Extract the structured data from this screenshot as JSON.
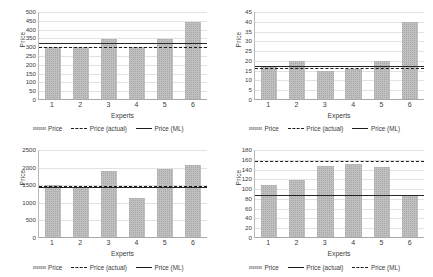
{
  "figure": {
    "panels": [
      "chart-top-left",
      "chart-top-right",
      "chart-bottom-left",
      "chart-bottom-right"
    ],
    "bar_color": "#bfbfbf",
    "line_color": "#1d1d1d",
    "grid_color": "#e2e2e2"
  },
  "chart_data": [
    {
      "id": "chart-top-left",
      "type": "bar",
      "title": "",
      "xlabel": "Experts",
      "ylabel": "Price",
      "categories": [
        "1",
        "2",
        "3",
        "4",
        "5",
        "6"
      ],
      "yticks": [
        0,
        50,
        100,
        150,
        200,
        250,
        300,
        350,
        400,
        450,
        500
      ],
      "ylim": [
        0,
        500
      ],
      "grid": true,
      "legend_position": "bottom",
      "series": [
        {
          "name": "Price",
          "style": "bar",
          "values": [
            300,
            300,
            345,
            300,
            345,
            445
          ]
        },
        {
          "name": "Price (actual)",
          "style": "dashed-line",
          "value": 300
        },
        {
          "name": "Price (ML)",
          "style": "solid-line",
          "value": 322
        }
      ],
      "legend": [
        {
          "label": "Price",
          "swatch": "bar"
        },
        {
          "label": "Price (actual)",
          "swatch": "dashed"
        },
        {
          "label": "Price (ML)",
          "swatch": "solid"
        }
      ]
    },
    {
      "id": "chart-top-right",
      "type": "bar",
      "title": "",
      "xlabel": "Experts",
      "ylabel": "Price",
      "categories": [
        "1",
        "2",
        "3",
        "4",
        "5",
        "6"
      ],
      "yticks": [
        0,
        5,
        10,
        15,
        20,
        25,
        30,
        35,
        40,
        45
      ],
      "ylim": [
        0,
        45
      ],
      "grid": true,
      "legend_position": "bottom",
      "series": [
        {
          "name": "Price",
          "style": "bar",
          "values": [
            17,
            20,
            15,
            16,
            20,
            40
          ]
        },
        {
          "name": "Price (actual)",
          "style": "dashed-line",
          "value": 16.5
        },
        {
          "name": "Price (ML)",
          "style": "solid-line",
          "value": 17.2
        }
      ],
      "legend": [
        {
          "label": "Price",
          "swatch": "bar"
        },
        {
          "label": "Price (actual)",
          "swatch": "dashed"
        },
        {
          "label": "Price (ML)",
          "swatch": "solid"
        }
      ]
    },
    {
      "id": "chart-bottom-left",
      "type": "bar",
      "title": "",
      "xlabel": "Experts",
      "ylabel": "Price",
      "categories": [
        "1",
        "2",
        "3",
        "4",
        "5",
        "6"
      ],
      "yticks": [
        0,
        500,
        1000,
        1500,
        2000,
        2500
      ],
      "ylim": [
        0,
        2500
      ],
      "grid": true,
      "legend_position": "bottom",
      "series": [
        {
          "name": "Price",
          "style": "bar",
          "values": [
            1500,
            1450,
            1900,
            1150,
            1970,
            2070
          ]
        },
        {
          "name": "Price (actual)",
          "style": "dashed-line",
          "value": 1470
        },
        {
          "name": "Price (ML)",
          "style": "solid-line",
          "value": 1455
        }
      ],
      "legend": [
        {
          "label": "Price",
          "swatch": "bar"
        },
        {
          "label": "Price (actual)",
          "swatch": "dashed"
        },
        {
          "label": "Price (ML)",
          "swatch": "solid"
        }
      ]
    },
    {
      "id": "chart-bottom-right",
      "type": "bar",
      "title": "",
      "xlabel": "Experts",
      "ylabel": "Price",
      "categories": [
        "1",
        "2",
        "3",
        "4",
        "5",
        "6"
      ],
      "yticks": [
        0,
        20,
        40,
        60,
        80,
        100,
        120,
        140,
        160,
        180
      ],
      "ylim": [
        0,
        180
      ],
      "grid": true,
      "legend_position": "bottom",
      "series": [
        {
          "name": "Price",
          "style": "bar",
          "values": [
            108,
            118,
            147,
            152,
            146,
            88
          ]
        },
        {
          "name": "Price (actual)",
          "style": "solid-line",
          "value": 88
        },
        {
          "name": "Price (ML)",
          "style": "dashed-line",
          "value": 157
        }
      ],
      "legend": [
        {
          "label": "Price",
          "swatch": "bar"
        },
        {
          "label": "Price (actual)",
          "swatch": "solid"
        },
        {
          "label": "Price (ML)",
          "swatch": "dashed"
        }
      ]
    }
  ]
}
